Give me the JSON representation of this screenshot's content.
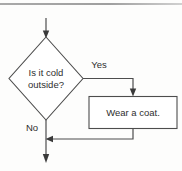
{
  "diagram": {
    "type": "flowchart",
    "background_color": "#fdfdfc",
    "line_color": "#4d4d4d",
    "text_color": "#2e2e2e",
    "nodes": [
      {
        "id": "decision",
        "shape": "diamond",
        "line1": "Is it cold",
        "line2": "outside?"
      },
      {
        "id": "action",
        "shape": "rectangle",
        "label": "Wear a coat."
      }
    ],
    "edge_labels": {
      "yes": "Yes",
      "no": "No"
    }
  }
}
